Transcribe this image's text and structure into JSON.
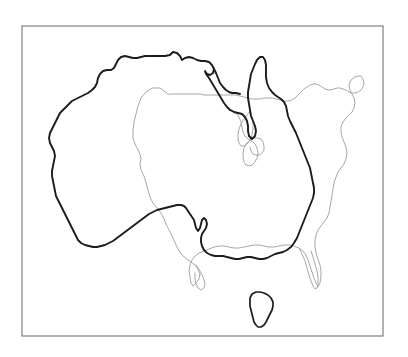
{
  "figure": {
    "title": "Australia overlaid on the contiguous United States",
    "background_color": "#ffffff",
    "width": 408,
    "height": 357
  },
  "frame": {
    "name": "plot-border",
    "x": 22,
    "y": 26,
    "width": 361,
    "height": 310,
    "stroke_color": "#737373",
    "stroke_width": 1.1
  },
  "layers": [
    {
      "id": "usa",
      "label": "Contiguous United States",
      "style": "light grey thin outline",
      "stroke_color": "#a8a8a8",
      "stroke_width": 1.0,
      "z": 1
    },
    {
      "id": "australia",
      "label": "Australia (mainland)",
      "style": "dark heavy outline",
      "stroke_color": "#1c1c1c",
      "stroke_width": 1.9,
      "z": 2
    },
    {
      "id": "tasmania",
      "label": "Tasmania",
      "style": "dark heavy outline",
      "stroke_color": "#1c1c1c",
      "stroke_width": 1.7,
      "z": 2
    }
  ],
  "geometry": {
    "usa_outline": "M 168,94 L 160,88 L 152,88 L 146,92 L 141,98 L 138,106 L 136,114 L 134,122 L 133,130 L 133,139 L 136,146 L 139,152 L 141,158 L 140,164 L 141,170 L 144,176 L 146,183 L 148,190 L 150,197 L 153,203 L 157,208 L 161,213 L 164,219 L 167,226 L 170,232 L 173,238 L 176,245 L 179,251 L 183,256 L 187,259 L 191,262 L 195,265 L 198,269 L 200,274 L 199,279 L 196,283 L 193,286 L 191,283 L 190,277 L 189,271 L 190,265 L 192,260 L 195,256 L 199,253 L 204,251 L 209,249 L 214,247 L 219,246 L 224,246 L 229,247 L 234,248 L 239,248 L 244,247 L 249,246 L 254,245 L 259,245 L 264,246 L 269,247 L 274,247 L 279,246 L 284,245 L 289,245 L 294,246 L 299,248 L 303,251 L 306,255 L 308,260 L 310,266 L 312,272 L 314,278 L 316,283 L 318,287 L 320,283 L 321,277 L 321,271 L 320,265 L 318,259 L 316,253 L 315,247 L 315,241 L 316,235 L 318,230 L 321,226 L 324,222 L 327,218 L 329,213 L 330,207 L 331,201 L 332,195 L 333,189 L 334,183 L 336,177 L 338,172 L 341,168 L 344,164 L 346,159 L 347,153 L 346,147 L 344,142 L 342,137 L 341,132 L 341,127 L 343,122 L 346,118 L 349,115 L 352,112 L 354,108 L 355,103 L 354,98 L 352,94 L 350,90 L 349,86 L 350,82 L 352,79 L 355,77 L 358,76 L 361,76 L 363,79 L 364,83 L 363,87 L 361,90 L 358,92 L 355,93 L 352,93 L 349,92 L 346,90 L 343,89 L 340,88 L 337,88 L 334,89 L 331,90 L 328,90 L 325,89 L 322,87 L 319,85 L 316,84 L 313,84 L 310,85 L 307,87 L 304,89 L 301,92 L 298,95 L 295,98 L 292,100 L 288,101 L 284,101 L 280,100 L 276,99 L 272,98 L 268,98 L 264,98 L 260,99 L 256,99 L 252,99 L 248,98 L 244,97 L 240,96 L 236,95 L 232,95 L 228,95 L 224,95 L 220,95 L 216,95 L 212,95 L 208,95 L 204,95 L 200,94 L 196,94 L 192,94 L 188,94 L 184,94 L 180,94 L 176,94 L 172,94 Z",
    "usa_great_lakes": "M 228,108 L 232,110 L 236,113 L 239,117 L 241,122 L 242,127 L 243,132 L 245,136 L 248,139 L 252,141 L 255,144 L 257,148 L 258,153 L 257,158 L 255,162 L 252,165 L 249,166 L 246,165 L 244,162 L 243,158 L 243,153 L 244,148 L 246,144 L 249,141 L 252,139 L 255,138 L 258,138 L 261,139 L 263,142 L 264,146 L 264,150 L 262,153 L 259,155 L 256,155 L 253,154 L 251,151 L 250,147",
    "usa_michigan": "M 250,112 L 252,117 L 253,123 L 253,129 L 252,135 L 250,140 L 247,144 L 244,146 L 241,146 L 239,143 L 238,139 L 238,134 L 239,129 L 241,124 L 244,119 L 247,115 Z",
    "usa_florida": "M 299,248 L 302,254 L 305,261 L 307,268 L 309,275 L 311,281 L 313,286 L 315,289 L 317,288 L 318,284 L 318,278 L 317,271 L 315,264 L 313,257 L 311,251",
    "usa_texas_gulf": "M 196,265 L 200,271 L 203,277 L 205,283 L 204,288 L 201,290 L 198,288 L 196,284 L 195,279 L 195,273",
    "australia_mainland": "M 170,55 L 173,52 L 177,53 L 180,56 L 182,60 L 185,58 L 189,57 L 193,58 L 197,60 L 201,61 L 205,61 L 209,62 L 212,65 L 214,69 L 213,73 L 210,75 L 207,74 L 205,71 L 206,74 L 209,78 L 212,83 L 215,88 L 218,93 L 221,98 L 224,103 L 227,107 L 230,110 L 234,112 L 238,113 L 242,114 L 245,117 L 247,121 L 248,126 L 248,131 L 249,136 L 252,139 L 255,136 L 256,131 L 255,126 L 253,121 L 251,116 L 250,110 L 249,104 L 248,98 L 248,92 L 249,86 L 250,80 L 251,74 L 253,69 L 255,64 L 257,60 L 260,57 L 263,57 L 265,60 L 266,65 L 266,71 L 266,77 L 267,83 L 269,88 L 272,92 L 275,95 L 278,97 L 281,99 L 284,102 L 286,106 L 287,111 L 288,116 L 290,121 L 292,125 L 294,129 L 296,133 L 298,138 L 300,143 L 302,148 L 304,153 L 306,158 L 308,163 L 310,168 L 311,173 L 312,178 L 313,183 L 314,188 L 314,193 L 313,198 L 311,203 L 309,208 L 307,213 L 305,218 L 303,223 L 301,228 L 299,233 L 297,238 L 294,243 L 291,247 L 287,250 L 283,252 L 279,253 L 275,254 L 271,256 L 267,258 L 263,259 L 259,259 L 255,258 L 251,257 L 247,257 L 243,258 L 239,259 L 235,259 L 231,258 L 227,257 L 223,256 L 219,256 L 215,256 L 211,255 L 207,253 L 204,250 L 202,246 L 201,242 L 201,238 L 202,234 L 204,231 L 206,228 L 207,224 L 206,220 L 204,218 L 202,220 L 201,224 L 200,228 L 198,231 L 196,228 L 195,224 L 194,220 L 192,217 L 190,214 L 188,211 L 186,208 L 184,206 L 181,205 L 177,205 L 173,206 L 169,207 L 165,208 L 161,209 L 157,210 L 153,212 L 149,214 L 145,217 L 141,220 L 137,223 L 133,226 L 129,229 L 125,232 L 121,235 L 117,238 L 113,241 L 109,243 L 105,245 L 101,246 L 97,247 L 93,247 L 89,246 L 85,245 L 81,243 L 78,240 L 76,236 L 74,232 L 72,228 L 70,224 L 68,220 L 66,216 L 64,212 L 62,208 L 60,204 L 58,200 L 56,196 L 55,191 L 54,186 L 53,181 L 52,176 L 52,171 L 53,166 L 54,161 L 55,156 L 54,151 L 52,147 L 50,143 L 49,138 L 50,133 L 52,129 L 54,125 L 56,121 L 58,117 L 60,113 L 63,110 L 66,107 L 69,104 L 72,101 L 76,99 L 80,97 L 84,95 L 88,93 L 92,90 L 95,87 L 97,83 L 98,78 L 100,74 L 103,71 L 107,70 L 111,70 L 114,68 L 116,64 L 118,60 L 121,57 L 125,56 L 129,57 L 133,58 L 137,58 L 141,57 L 145,56 L 149,56 L 153,56 L 157,56 L 161,56 L 165,56 Z",
    "australia_detail_gulf": "M 214,69 L 216,73 L 218,78 L 220,83 L 223,87 L 226,90 L 229,92 L 232,93 L 236,93 L 240,94",
    "tasmania": "M 252,294 L 256,292 L 260,292 L 264,293 L 268,295 L 271,298 L 273,302 L 273,306 L 272,310 L 270,314 L 268,318 L 266,322 L 264,325 L 261,327 L 258,327 L 256,325 L 254,322 L 253,318 L 252,314 L 251,310 L 250,306 L 250,302 L 250,298 Z"
  }
}
